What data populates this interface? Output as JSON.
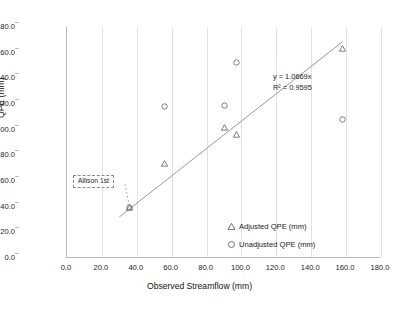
{
  "chart_data": {
    "type": "scatter",
    "title": "",
    "xlabel": "Observed Streamflow (mm)",
    "ylabel": "QPE (mm)",
    "xlim": [
      0,
      180
    ],
    "ylim": [
      0,
      180
    ],
    "xticks": [
      "0.0",
      "20.0",
      "40.0",
      "60.0",
      "80.0",
      "100.0",
      "120.0",
      "140.0",
      "160.0",
      "180.0"
    ],
    "yticks": [
      "0.0",
      "20.0",
      "40.0",
      "60.0",
      "80.0",
      "100.0",
      "120.0",
      "140.0",
      "160.0",
      "180.0"
    ],
    "xtick_values": [
      0,
      20,
      40,
      60,
      80,
      100,
      120,
      140,
      160,
      180
    ],
    "ytick_values": [
      0,
      20,
      40,
      60,
      80,
      100,
      120,
      140,
      160,
      180
    ],
    "grid": "vertical",
    "legend_position": "inside-bottom-right",
    "series": [
      {
        "name": "Adjusted QPE (mm)",
        "marker": "triangle",
        "color": "#6f6f6f",
        "points": [
          {
            "x": 36,
            "y": 39
          },
          {
            "x": 56,
            "y": 74
          },
          {
            "x": 90,
            "y": 102
          },
          {
            "x": 97,
            "y": 96
          },
          {
            "x": 158,
            "y": 163
          }
        ]
      },
      {
        "name": "Unadjusted QPE (mm)",
        "marker": "circle",
        "color": "#6f6f6f",
        "points": [
          {
            "x": 36,
            "y": 39
          },
          {
            "x": 56,
            "y": 118
          },
          {
            "x": 90,
            "y": 119
          },
          {
            "x": 97,
            "y": 152
          },
          {
            "x": 158,
            "y": 108
          }
        ]
      }
    ],
    "trendline": {
      "equation": "y = 1.0669x",
      "r_squared": "R² = 0.9595",
      "slope": 1.0669,
      "intercept": 0,
      "x_start": 30,
      "x_end": 158
    },
    "annotations": [
      {
        "label": "Allison 1st",
        "target_x": 36,
        "target_y": 39
      }
    ]
  },
  "legend": {
    "items": [
      {
        "label": "Adjusted QPE (mm)",
        "marker": "triangle"
      },
      {
        "label": "Unadjusted QPE (mm)",
        "marker": "circle"
      }
    ]
  },
  "equation": {
    "line1": "y = 1.0669x",
    "line2": "R² = 0.9595"
  },
  "annotation": {
    "allison_label": "Allison 1st"
  },
  "axes": {
    "x_title": "Observed Streamflow (mm)",
    "y_title": "QPE (mm)"
  },
  "caption": {
    "partial_text": ""
  }
}
